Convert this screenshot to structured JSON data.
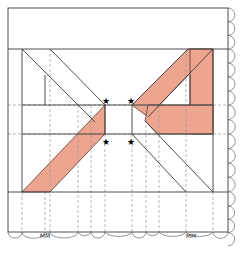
{
  "diagram": {
    "colors": {
      "fill": "#eea58f",
      "line": "#3a3a3a",
      "dashed": "#9a9a9a",
      "background": "#ffffff"
    },
    "markers": {
      "symbol": "★",
      "count": 4
    },
    "ruler_labels": {
      "left_cluster": "MM",
      "right_cluster": "MM"
    }
  }
}
